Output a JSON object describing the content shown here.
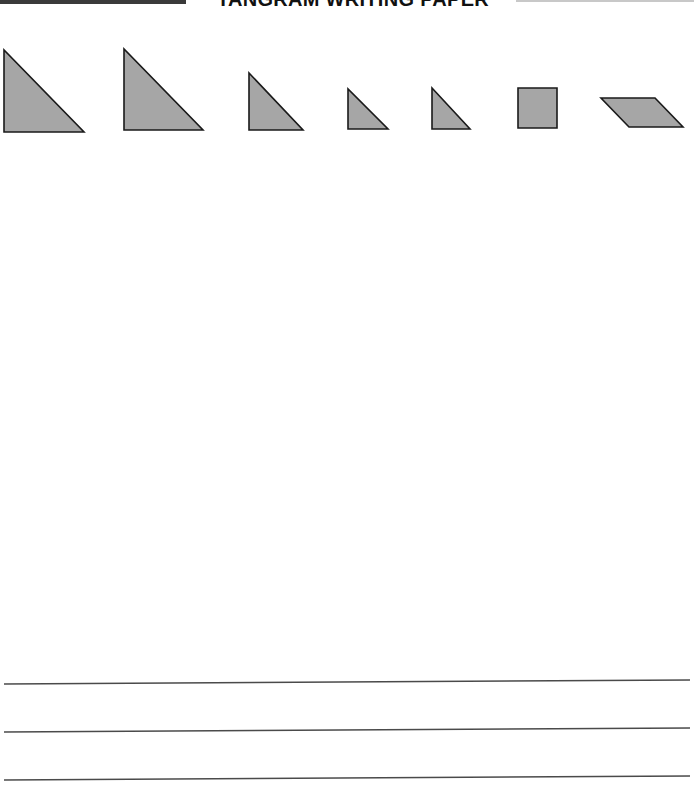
{
  "header": {
    "title": "TANGRAM WRITING PAPER"
  },
  "colors": {
    "shape_fill": "#a6a6a6",
    "shape_stroke": "#1a1a1a",
    "line_color": "#4a4a4a",
    "header_bar_dark": "#3a3a3a",
    "header_bar_light": "#c8c8c8"
  },
  "tangram_pieces": [
    {
      "name": "large-triangle-1",
      "type": "triangle",
      "points": "4,50 4,132 84,132"
    },
    {
      "name": "large-triangle-2",
      "type": "triangle",
      "points": "124,49 124,130 203,130"
    },
    {
      "name": "medium-triangle",
      "type": "triangle",
      "points": "249,73 249,130 303,130"
    },
    {
      "name": "small-triangle-1",
      "type": "triangle",
      "points": "348,89 348,129 388,129"
    },
    {
      "name": "small-triangle-2",
      "type": "triangle",
      "points": "432,88 432,129 470,129"
    },
    {
      "name": "square",
      "type": "square",
      "points": "518,88 557,88 557,128 518,128"
    },
    {
      "name": "parallelogram",
      "type": "parallelogram",
      "points": "601,98 655,98 683,127 629,127"
    }
  ],
  "writing_lines": [
    {
      "x1": 4,
      "y1": 24,
      "x2": 690,
      "y2": 20
    },
    {
      "x1": 4,
      "y1": 72,
      "x2": 690,
      "y2": 68
    },
    {
      "x1": 4,
      "y1": 120,
      "x2": 690,
      "y2": 116
    }
  ]
}
